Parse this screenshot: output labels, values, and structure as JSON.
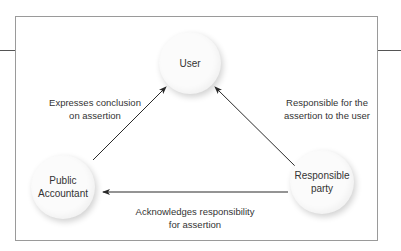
{
  "diagram": {
    "type": "relationship-triangle",
    "nodes": {
      "user": {
        "label": "User"
      },
      "public_accountant": {
        "label_line1": "Public",
        "label_line2": "Accountant"
      },
      "responsible_party": {
        "label_line1": "Responsible",
        "label_line2": "party"
      }
    },
    "edges": {
      "accountant_to_user": {
        "from": "Public Accountant",
        "to": "User",
        "label_line1": "Expresses conclusion",
        "label_line2": "on assertion"
      },
      "party_to_user": {
        "from": "Responsible party",
        "to": "User",
        "label_line1": "Responsible for the",
        "label_line2": "assertion to the user"
      },
      "party_to_accountant": {
        "from": "Responsible party",
        "to": "Public Accountant",
        "label_line1": "Acknowledges responsibility",
        "label_line2": "for assertion"
      }
    },
    "colors": {
      "line": "#2a2a2a",
      "frame": "#9a9a9a",
      "node_fill": "#fbfbfb"
    }
  }
}
